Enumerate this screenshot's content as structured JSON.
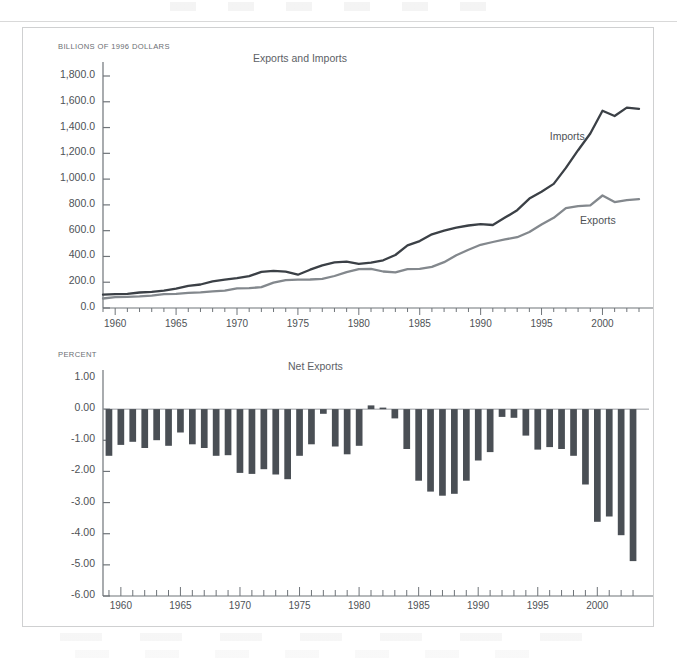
{
  "page": {
    "background": "#ffffff",
    "frame_border_color": "#cfd0d1"
  },
  "colors": {
    "imports_line": "#3b4046",
    "exports_line": "#83888d",
    "bar_fill": "#4a4f55",
    "axis": "#6f7479",
    "text": "#4e5256"
  },
  "top_chart": {
    "unit_label": "BILLIONS OF 1996 DOLLARS",
    "title": "Exports and Imports",
    "series_labels": {
      "imports": "Imports",
      "exports": "Exports"
    },
    "y_ticks": [
      "0.0",
      "200.0",
      "400.0",
      "600.0",
      "800.0",
      "1,000.0",
      "1,200.0",
      "1,400.0",
      "1,600.0",
      "1,800.0"
    ],
    "x_ticks": [
      "1960",
      "1965",
      "1970",
      "1975",
      "1980",
      "1985",
      "1990",
      "1995",
      "2000"
    ]
  },
  "bottom_chart": {
    "unit_label": "PERCENT",
    "title": "Net Exports",
    "y_ticks": [
      "-6.00",
      "-5.00",
      "-4.00",
      "-3.00",
      "-2.00",
      "-1.00",
      "0.00",
      "1.00"
    ],
    "x_ticks": [
      "1960",
      "1965",
      "1970",
      "1975",
      "1980",
      "1985",
      "1990",
      "1995",
      "2000"
    ]
  },
  "chart_data": [
    {
      "type": "line",
      "title": "Exports and Imports",
      "xlabel": "",
      "ylabel": "BILLIONS OF 1996 DOLLARS",
      "ylim": [
        0,
        1800
      ],
      "xlim": [
        1959,
        2003
      ],
      "grid": false,
      "legend": "inline-annotation",
      "x": [
        1959,
        1960,
        1961,
        1962,
        1963,
        1964,
        1965,
        1966,
        1967,
        1968,
        1969,
        1970,
        1971,
        1972,
        1973,
        1974,
        1975,
        1976,
        1977,
        1978,
        1979,
        1980,
        1981,
        1982,
        1983,
        1984,
        1985,
        1986,
        1987,
        1988,
        1989,
        1990,
        1991,
        1992,
        1993,
        1994,
        1995,
        1996,
        1997,
        1998,
        1999,
        2000,
        2001,
        2002,
        2003
      ],
      "series": [
        {
          "name": "Imports",
          "color": "#3b4046",
          "values": [
            103,
            108,
            110,
            120,
            126,
            134,
            150,
            172,
            182,
            207,
            220,
            231,
            247,
            280,
            289,
            282,
            258,
            297,
            331,
            354,
            359,
            343,
            352,
            370,
            411,
            486,
            519,
            572,
            600,
            623,
            640,
            650,
            644,
            701,
            759,
            849,
            902,
            963,
            1087,
            1224,
            1354,
            1530,
            1490,
            1555,
            1545
          ]
        },
        {
          "name": "Exports",
          "color": "#83888d",
          "values": [
            74,
            84,
            86,
            90,
            96,
            107,
            110,
            117,
            121,
            129,
            135,
            152,
            154,
            162,
            196,
            216,
            220,
            221,
            226,
            248,
            278,
            302,
            303,
            283,
            277,
            302,
            303,
            320,
            355,
            410,
            452,
            490,
            512,
            532,
            549,
            590,
            647,
            700,
            774,
            790,
            796,
            873,
            822,
            836,
            844
          ]
        }
      ]
    },
    {
      "type": "bar",
      "title": "Net Exports",
      "xlabel": "",
      "ylabel": "PERCENT",
      "ylim": [
        1.0,
        -6.0
      ],
      "y_inverted": true,
      "grid": false,
      "note": "Values are net exports as percent of GDP; plotted downward (deficits upward on inverted axis).",
      "categories": [
        1959,
        1960,
        1961,
        1962,
        1963,
        1964,
        1965,
        1966,
        1967,
        1968,
        1969,
        1970,
        1971,
        1972,
        1973,
        1974,
        1975,
        1976,
        1977,
        1978,
        1979,
        1980,
        1981,
        1982,
        1983,
        1984,
        1985,
        1986,
        1987,
        1988,
        1989,
        1990,
        1991,
        1992,
        1993,
        1994,
        1995,
        1996,
        1997,
        1998,
        1999,
        2000,
        2001,
        2002,
        2003
      ],
      "values": [
        -1.5,
        -1.15,
        -1.05,
        -1.25,
        -1.0,
        -1.18,
        -0.75,
        -1.13,
        -1.25,
        -1.5,
        -1.48,
        -2.05,
        -2.08,
        -1.93,
        -2.1,
        -2.25,
        -1.5,
        -1.13,
        -0.15,
        -1.2,
        -1.45,
        -1.18,
        0.12,
        0.05,
        -0.3,
        -1.28,
        -2.3,
        -2.65,
        -2.78,
        -2.72,
        -2.3,
        -1.65,
        -1.38,
        -0.25,
        -0.28,
        -0.85,
        -1.3,
        -1.22,
        -1.28,
        -1.5,
        -2.42,
        -3.62,
        -3.45,
        -4.05,
        -4.88
      ]
    }
  ]
}
